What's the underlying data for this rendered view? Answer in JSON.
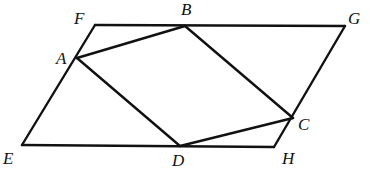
{
  "diagram": {
    "points": {
      "E": {
        "x": 22,
        "y": 145
      },
      "F": {
        "x": 95,
        "y": 25
      },
      "G": {
        "x": 345,
        "y": 26
      },
      "H": {
        "x": 274,
        "y": 147
      },
      "A": {
        "x": 77,
        "y": 58
      },
      "B": {
        "x": 185,
        "y": 26
      },
      "C": {
        "x": 293,
        "y": 118
      },
      "D": {
        "x": 180,
        "y": 146
      }
    },
    "labels": [
      {
        "text": "F",
        "x": 74,
        "y": 24
      },
      {
        "text": "B",
        "x": 181,
        "y": 15
      },
      {
        "text": "G",
        "x": 348,
        "y": 24
      },
      {
        "text": "A",
        "x": 56,
        "y": 64
      },
      {
        "text": "E",
        "x": 3,
        "y": 164
      },
      {
        "text": "D",
        "x": 172,
        "y": 166
      },
      {
        "text": "H",
        "x": 282,
        "y": 164
      },
      {
        "text": "C",
        "x": 298,
        "y": 130
      }
    ],
    "segments": [
      [
        "E",
        "F"
      ],
      [
        "F",
        "G"
      ],
      [
        "G",
        "H"
      ],
      [
        "H",
        "E"
      ],
      [
        "A",
        "B"
      ],
      [
        "B",
        "C"
      ],
      [
        "C",
        "D"
      ],
      [
        "D",
        "A"
      ]
    ],
    "stroke_color": "#111111"
  }
}
